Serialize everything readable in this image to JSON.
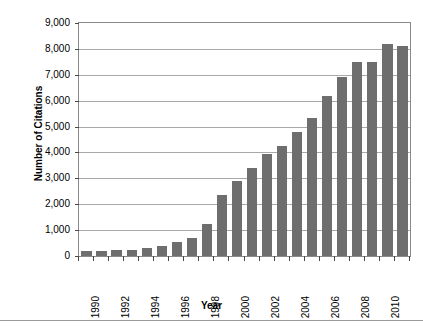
{
  "chart_data": {
    "type": "bar",
    "title": "",
    "xlabel": "Year",
    "ylabel": "Number of Citations",
    "ylim": [
      0,
      9000
    ],
    "ytick_step": 1000,
    "grid": true,
    "legend": null,
    "bar_color": "#6e6e6e",
    "gridline_color": "#a8a8a8",
    "axis_color": "#8a8a8a",
    "categories": [
      "1990",
      "1991",
      "1992",
      "1993",
      "1994",
      "1995",
      "1996",
      "1997",
      "1998",
      "1999",
      "2000",
      "2001",
      "2002",
      "2003",
      "2004",
      "2005",
      "2006",
      "2007",
      "2008",
      "2009",
      "2010",
      "2011"
    ],
    "values": [
      200,
      210,
      230,
      240,
      300,
      400,
      550,
      700,
      1250,
      2350,
      2900,
      3400,
      3950,
      4250,
      4800,
      5350,
      6200,
      6900,
      7500,
      7500,
      8200,
      8100
    ],
    "ytick_labels": [
      "9,000",
      "8,000",
      "7,000",
      "6,000",
      "5,000",
      "4,000",
      "3,000",
      "2,000",
      "1,000",
      "0"
    ],
    "ytick_values": [
      9000,
      8000,
      7000,
      6000,
      5000,
      4000,
      3000,
      2000,
      1000,
      0
    ],
    "xtick_labels": [
      "1990",
      "1992",
      "1994",
      "1996",
      "1998",
      "2000",
      "2002",
      "2004",
      "2006",
      "2008",
      "2010"
    ],
    "xtick_categories": [
      "1990",
      "1992",
      "1994",
      "1996",
      "1998",
      "2000",
      "2002",
      "2004",
      "2006",
      "2008",
      "2010"
    ]
  }
}
